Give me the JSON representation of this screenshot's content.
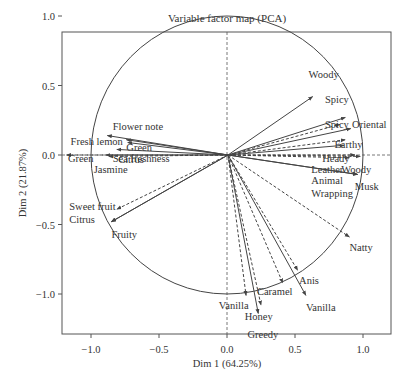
{
  "chart_data": {
    "type": "scatter",
    "subtype": "pca-correlation-circle",
    "title": "Variable factor map (PCA)",
    "xlabel": "Dim 1 (64.25%)",
    "ylabel": "Dim 2 (21.87%)",
    "xlim": [
      -1.2,
      1.2
    ],
    "ylim": [
      -1.1,
      1.1
    ],
    "xticks": [
      "-1.0",
      "-0.5",
      "0.0",
      "0.5",
      "1.0"
    ],
    "yticks": [
      "-1.0",
      "-0.5",
      "0.0",
      "0.5",
      "1.0"
    ],
    "grid": false,
    "unit_circle": true,
    "reference_lines": [
      "x=0 dashed",
      "y=0 dashed"
    ],
    "variables": [
      {
        "name": "Woody",
        "x": 0.63,
        "y": 0.42,
        "style": "solid",
        "lx": 0.6,
        "ly": 0.58
      },
      {
        "name": "Spicy",
        "x": 0.87,
        "y": 0.27,
        "style": "solid",
        "lx": 0.72,
        "ly": 0.4
      },
      {
        "name": "Spicy",
        "x": 0.83,
        "y": 0.22,
        "style": "dashed",
        "lx": 0.72,
        "ly": 0.22
      },
      {
        "name": "Oriental",
        "x": 0.91,
        "y": 0.19,
        "style": "solid",
        "lx": 0.92,
        "ly": 0.22
      },
      {
        "name": "Earthy",
        "x": 0.87,
        "y": 0.11,
        "style": "dashed",
        "lx": 0.79,
        "ly": 0.08
      },
      {
        "name": "Heady",
        "x": 0.86,
        "y": 0.07,
        "style": "solid",
        "lx": 0.7,
        "ly": -0.02
      },
      {
        "name": "Leather",
        "x": 0.94,
        "y": 0.0,
        "style": "dashed",
        "lx": 0.62,
        "ly": -0.1
      },
      {
        "name": "Woody",
        "x": 0.98,
        "y": -0.01,
        "style": "dashed",
        "lx": 0.84,
        "ly": -0.1
      },
      {
        "name": "Animal",
        "x": 0.9,
        "y": -0.02,
        "style": "dashed",
        "lx": 0.62,
        "ly": -0.18
      },
      {
        "name": "Wrapping",
        "x": 0.96,
        "y": -0.14,
        "style": "solid",
        "lx": 0.62,
        "ly": -0.27
      },
      {
        "name": "Musk",
        "x": 0.96,
        "y": -0.14,
        "style": "solid",
        "lx": 0.94,
        "ly": -0.22
      },
      {
        "name": "Natty",
        "x": 0.9,
        "y": -0.59,
        "style": "dashed",
        "lx": 0.9,
        "ly": -0.66
      },
      {
        "name": "Anis",
        "x": 0.52,
        "y": -0.83,
        "style": "dashed",
        "lx": 0.53,
        "ly": -0.9
      },
      {
        "name": "Vanilla",
        "x": 0.58,
        "y": -1.01,
        "style": "solid",
        "lx": 0.58,
        "ly": -1.09
      },
      {
        "name": "Caramel",
        "x": 0.41,
        "y": -0.92,
        "style": "dashed",
        "lx": 0.22,
        "ly": -0.98
      },
      {
        "name": "Honey",
        "x": 0.23,
        "y": -1.14,
        "style": "solid",
        "lx": 0.13,
        "ly": -1.16
      },
      {
        "name": "Greedy",
        "x": 0.25,
        "y": -1.08,
        "style": "dashed",
        "lx": 0.15,
        "ly": -1.29
      },
      {
        "name": "Vanilla",
        "x": 0.14,
        "y": -1.01,
        "style": "dashed",
        "lx": -0.06,
        "ly": -1.08
      },
      {
        "name": "Flower note",
        "x": -0.88,
        "y": 0.14,
        "style": "solid",
        "lx": -0.84,
        "ly": 0.21
      },
      {
        "name": "Fresh lemon",
        "x": -0.74,
        "y": 0.11,
        "style": "solid",
        "lx": -1.15,
        "ly": 0.1
      },
      {
        "name": "Green",
        "x": -0.73,
        "y": 0.09,
        "style": "solid",
        "lx": -0.74,
        "ly": 0.06
      },
      {
        "name": "Citrus",
        "x": -0.81,
        "y": 0.04,
        "style": "solid",
        "lx": -0.8,
        "ly": -0.03
      },
      {
        "name": "Jasmine",
        "x": -0.89,
        "y": 0.0,
        "style": "solid",
        "lx": -0.98,
        "ly": -0.1
      },
      {
        "name": "Green",
        "x": -1.18,
        "y": 0.0,
        "style": "dashed",
        "lx": -1.17,
        "ly": -0.02
      },
      {
        "name": "Sea freshness",
        "x": -0.87,
        "y": -0.01,
        "style": "dashed",
        "lx": -0.84,
        "ly": -0.02
      },
      {
        "name": "Sweet fruit",
        "x": -0.81,
        "y": -0.39,
        "style": "dashed",
        "lx": -1.16,
        "ly": -0.37
      },
      {
        "name": "Citrus",
        "x": -0.85,
        "y": -0.48,
        "style": "solid",
        "lx": -1.16,
        "ly": -0.46
      },
      {
        "name": "Fruity",
        "x": -0.85,
        "y": -0.48,
        "style": "solid",
        "lx": -0.85,
        "ly": -0.57
      }
    ]
  }
}
